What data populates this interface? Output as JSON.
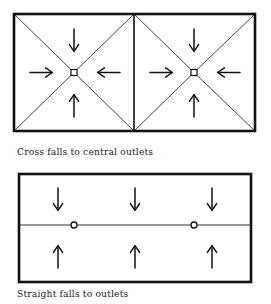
{
  "figure": {
    "background_color": "#ffffff",
    "line_color": "#111111",
    "panels": [
      {
        "id": "cross-falls-panel",
        "caption": "Cross falls to central outlets",
        "frame": {
          "x": 14,
          "y": 14,
          "width": 241,
          "height": 117
        },
        "divider": {
          "type": "vertical-line",
          "x": 134,
          "y1": 14,
          "y2": 131
        },
        "cells": [
          {
            "id": "left-cell",
            "outlet": {
              "shape": "square",
              "x": 74,
              "y": 72.5,
              "size": 6
            },
            "diagonals": "corner-to-centre-X",
            "arrows": [
              {
                "direction": "down",
                "glyph": "↓",
                "x": 74,
                "y": 40
              },
              {
                "direction": "right",
                "glyph": "→",
                "x": 41,
                "y": 72.5
              },
              {
                "direction": "left",
                "glyph": "←",
                "x": 109,
                "y": 72.5
              },
              {
                "direction": "up",
                "glyph": "↑",
                "x": 74,
                "y": 106
              }
            ]
          },
          {
            "id": "right-cell",
            "outlet": {
              "shape": "square",
              "x": 194,
              "y": 72.5,
              "size": 6
            },
            "diagonals": "corner-to-centre-X",
            "arrows": [
              {
                "direction": "down",
                "glyph": "↓",
                "x": 194,
                "y": 40
              },
              {
                "direction": "right",
                "glyph": "→",
                "x": 161,
                "y": 72.5
              },
              {
                "direction": "left",
                "glyph": "←",
                "x": 229,
                "y": 72.5
              },
              {
                "direction": "up",
                "glyph": "↑",
                "x": 194,
                "y": 106
              }
            ]
          }
        ]
      },
      {
        "id": "straight-falls-panel",
        "caption": "Straight falls to outlets",
        "frame": {
          "x": 19,
          "y": 174,
          "width": 232,
          "height": 108
        },
        "divider": {
          "type": "horizontal-line",
          "y": 225,
          "x1": 19,
          "x2": 251
        },
        "outlets": [
          {
            "shape": "circle",
            "x": 74,
            "y": 225,
            "radius": 3
          },
          {
            "shape": "circle",
            "x": 194,
            "y": 225,
            "radius": 3
          }
        ],
        "arrows": [
          {
            "direction": "down",
            "glyph": "↓",
            "x": 58,
            "y": 199
          },
          {
            "direction": "down",
            "glyph": "↓",
            "x": 135,
            "y": 199
          },
          {
            "direction": "down",
            "glyph": "↓",
            "x": 212,
            "y": 199
          },
          {
            "direction": "up",
            "glyph": "↑",
            "x": 58,
            "y": 257
          },
          {
            "direction": "up",
            "glyph": "↑",
            "x": 135,
            "y": 257
          },
          {
            "direction": "up",
            "glyph": "↑",
            "x": 212,
            "y": 257
          }
        ]
      }
    ]
  }
}
